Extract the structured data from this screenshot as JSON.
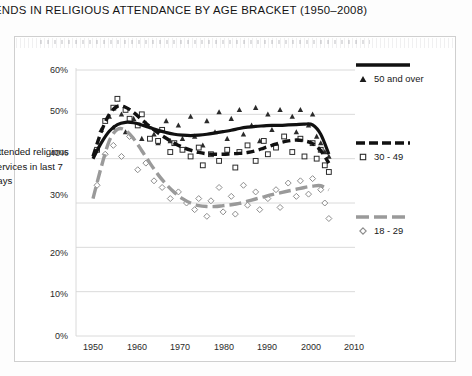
{
  "chart_title": "ENDS IN RELIGIOUS ATTENDANCE BY AGE BRACKET (1950–2008)",
  "y_axis_caption": "Attended religious services in last 7 days",
  "legend": {
    "entries": [
      {
        "label": "50 and over",
        "marker": "filled-triangle-marker",
        "style": "solid",
        "color": "#111111"
      },
      {
        "label": "30 - 49",
        "marker": "open-square-marker",
        "style": "dashed",
        "color": "#111111"
      },
      {
        "label": "18 - 29",
        "marker": "open-diamond-marker",
        "style": "dashed",
        "color": "#9a9a9a"
      }
    ]
  },
  "axis": {
    "y_ticks": [
      "0%",
      "10%",
      "20%",
      "30%",
      "40%",
      "50%",
      "60%"
    ],
    "x_ticks": [
      "1950",
      "1960",
      "1970",
      "1980",
      "1990",
      "2000",
      "2010"
    ]
  },
  "chart_data": {
    "type": "line",
    "title": "ENDS IN RELIGIOUS ATTENDANCE BY AGE BRACKET (1950–2008)",
    "xlabel": "",
    "ylabel": "Attended religious services in last 7 days",
    "xlim": [
      1950,
      2010
    ],
    "ylim": [
      0,
      60
    ],
    "ytick_values": [
      0,
      10,
      20,
      30,
      40,
      50,
      60
    ],
    "xtick_values": [
      1950,
      1960,
      1970,
      1980,
      1990,
      2000,
      2010
    ],
    "grid": "horizontal",
    "legend_position": "right",
    "series": [
      {
        "name": "50 and over",
        "style": "solid",
        "color": "#111111",
        "marker": "filled-triangle",
        "trend_x": [
          1950,
          1952,
          1954,
          1956,
          1958,
          1960,
          1962,
          1964,
          1966,
          1968,
          1970,
          1972,
          1974,
          1976,
          1978,
          1980,
          1982,
          1984,
          1986,
          1988,
          1990,
          1992,
          1994,
          1996,
          1998,
          2000,
          2002,
          2004,
          2006,
          2008
        ],
        "trend_y": [
          40.0,
          43.5,
          46.2,
          47.7,
          48.2,
          48.1,
          47.6,
          47.0,
          46.4,
          45.9,
          45.5,
          45.3,
          45.2,
          45.3,
          45.5,
          45.8,
          46.1,
          46.4,
          46.8,
          47.1,
          47.3,
          47.4,
          47.5,
          47.5,
          47.6,
          47.7,
          47.8,
          47.6,
          45.5,
          41.0
        ],
        "points_x": [
          1952,
          1954,
          1955,
          1957,
          1958,
          1960,
          1962,
          1963,
          1965,
          1966,
          1968,
          1969,
          1971,
          1972,
          1974,
          1975,
          1977,
          1978,
          1980,
          1981,
          1983,
          1984,
          1986,
          1987,
          1989,
          1990,
          1991,
          1993,
          1994,
          1996,
          1997,
          1999,
          2000,
          2001,
          2003,
          2004,
          2005,
          2006,
          2007,
          2008
        ],
        "points_y": [
          46.5,
          49.5,
          47.0,
          50.0,
          46.0,
          49.0,
          44.5,
          48.0,
          45.5,
          43.5,
          48.5,
          44.0,
          47.5,
          44.5,
          49.5,
          45.0,
          43.0,
          48.5,
          46.0,
          50.5,
          44.5,
          49.0,
          51.0,
          45.5,
          47.5,
          51.5,
          44.0,
          50.0,
          46.5,
          51.0,
          45.0,
          49.5,
          46.0,
          51.0,
          47.5,
          50.0,
          45.0,
          43.5,
          41.5,
          40.5
        ]
      },
      {
        "name": "30 - 49",
        "style": "dashed",
        "color": "#111111",
        "marker": "open-square",
        "trend_x": [
          1950,
          1952,
          1954,
          1956,
          1958,
          1960,
          1962,
          1964,
          1966,
          1968,
          1970,
          1972,
          1974,
          1976,
          1978,
          1980,
          1982,
          1984,
          1986,
          1988,
          1990,
          1992,
          1994,
          1996,
          1998,
          2000,
          2002,
          2004,
          2006,
          2008
        ],
        "trend_y": [
          40.5,
          46.0,
          50.0,
          51.8,
          51.6,
          50.4,
          48.8,
          47.2,
          45.8,
          44.6,
          43.5,
          42.6,
          41.9,
          41.4,
          41.1,
          41.0,
          41.0,
          41.1,
          41.2,
          41.4,
          41.8,
          42.4,
          43.0,
          43.6,
          44.0,
          44.2,
          44.0,
          43.4,
          41.8,
          39.0
        ],
        "points_x": [
          1951,
          1953,
          1955,
          1956,
          1958,
          1959,
          1961,
          1962,
          1964,
          1966,
          1967,
          1969,
          1970,
          1972,
          1974,
          1976,
          1977,
          1979,
          1981,
          1983,
          1985,
          1986,
          1988,
          1990,
          1992,
          1993,
          1995,
          1997,
          1999,
          2001,
          2002,
          2004,
          2005,
          2006,
          2007,
          2008
        ],
        "points_y": [
          42.0,
          48.5,
          51.5,
          53.5,
          51.0,
          49.0,
          47.5,
          50.0,
          44.5,
          44.0,
          46.5,
          41.5,
          43.5,
          42.0,
          40.5,
          42.5,
          38.5,
          41.0,
          39.5,
          42.0,
          38.0,
          41.5,
          43.0,
          39.5,
          44.0,
          41.0,
          42.5,
          45.0,
          41.5,
          44.5,
          40.5,
          43.5,
          40.0,
          42.0,
          38.5,
          37.0
        ]
      },
      {
        "name": "18 - 29",
        "style": "dashed",
        "color": "#9a9a9a",
        "marker": "open-diamond",
        "trend_x": [
          1950,
          1952,
          1954,
          1956,
          1958,
          1960,
          1962,
          1964,
          1966,
          1968,
          1970,
          1972,
          1974,
          1976,
          1978,
          1980,
          1982,
          1984,
          1986,
          1988,
          1990,
          1992,
          1994,
          1996,
          1998,
          2000,
          2002,
          2004,
          2006,
          2008
        ],
        "trend_y": [
          31.0,
          38.0,
          44.0,
          46.6,
          46.4,
          44.5,
          41.8,
          39.0,
          36.4,
          34.2,
          32.4,
          31.0,
          30.0,
          29.4,
          29.2,
          29.2,
          29.4,
          29.6,
          29.9,
          30.4,
          30.9,
          31.4,
          31.9,
          32.3,
          32.7,
          33.1,
          33.5,
          33.8,
          33.9,
          33.0
        ],
        "points_x": [
          1951,
          1953,
          1955,
          1957,
          1959,
          1961,
          1963,
          1965,
          1967,
          1969,
          1971,
          1973,
          1975,
          1976,
          1978,
          1979,
          1981,
          1982,
          1984,
          1985,
          1987,
          1988,
          1990,
          1991,
          1993,
          1995,
          1996,
          1998,
          2000,
          2001,
          2003,
          2004,
          2006,
          2007,
          2008
        ],
        "points_y": [
          34.0,
          41.0,
          43.0,
          40.5,
          45.0,
          37.5,
          39.0,
          35.0,
          33.5,
          31.0,
          32.5,
          30.0,
          28.5,
          31.0,
          27.0,
          30.5,
          33.5,
          28.0,
          31.5,
          27.5,
          34.0,
          29.5,
          32.5,
          28.5,
          31.0,
          33.0,
          29.0,
          34.5,
          31.5,
          35.0,
          32.0,
          35.5,
          33.0,
          30.0,
          26.5
        ]
      }
    ]
  }
}
